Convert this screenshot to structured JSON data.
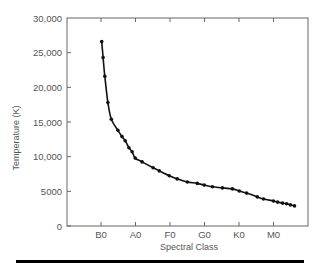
{
  "chart_data": {
    "type": "line",
    "title": "",
    "xlabel": "Spectral Class",
    "ylabel": "Temperature (K)",
    "x_categories": [
      "B0",
      "A0",
      "F0",
      "G0",
      "K0",
      "M0"
    ],
    "y_ticks": [
      0,
      5000,
      10000,
      15000,
      20000,
      25000,
      30000
    ],
    "y_tick_labels": [
      "0",
      "5000",
      "10,000",
      "15,000",
      "20,000",
      "25,000",
      "30,000"
    ],
    "ylim": [
      0,
      30000
    ],
    "xlim": [
      -1,
      6
    ],
    "grid": false,
    "legend": null,
    "x_note": "x values are spectral-class positions where B0=0, A0=1, F0=2, G0=3, K0=4, M0=5",
    "series": [
      {
        "name": "Temperature",
        "marker": "circle",
        "color": "#111111",
        "x": [
          0.02,
          0.06,
          0.11,
          0.2,
          0.3,
          0.49,
          0.61,
          0.7,
          0.81,
          0.9,
          0.99,
          1.19,
          1.51,
          1.69,
          1.98,
          2.21,
          2.5,
          2.79,
          2.99,
          3.23,
          3.52,
          3.81,
          4.01,
          4.22,
          4.53,
          4.71,
          5.0,
          5.12,
          5.26,
          5.38,
          5.49,
          5.61
        ],
        "y": [
          26600,
          24300,
          21600,
          17800,
          15400,
          13800,
          12900,
          12300,
          11300,
          10700,
          9800,
          9250,
          8400,
          7950,
          7250,
          6800,
          6350,
          6150,
          5900,
          5650,
          5500,
          5350,
          5050,
          4750,
          4200,
          3900,
          3600,
          3450,
          3300,
          3200,
          3050,
          2900
        ]
      }
    ]
  },
  "labels": {
    "xlabel": "Spectral Class",
    "ylabel": "Temperature (K)",
    "x0": "B0",
    "x1": "A0",
    "x2": "F0",
    "x3": "G0",
    "x4": "K0",
    "x5": "M0",
    "y0": "0",
    "y1": "5000",
    "y2": "10,000",
    "y3": "15,000",
    "y4": "20,000",
    "y5": "25,000",
    "y6": "30,000"
  },
  "colors": {
    "axis": "#666666",
    "text": "#555555",
    "curve": "#111111",
    "bottom_bar": "#000000"
  }
}
